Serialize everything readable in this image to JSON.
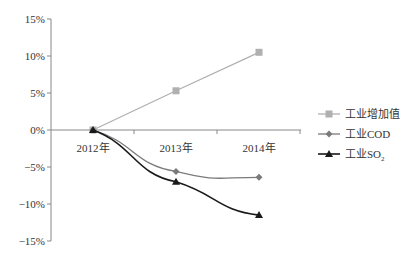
{
  "chart_data": {
    "type": "line",
    "title": "",
    "xlabel": "",
    "ylabel": "",
    "categories": [
      "2012年",
      "2013年",
      "2014年"
    ],
    "ylim": [
      -15,
      15
    ],
    "yticks": [
      15,
      10,
      5,
      0,
      -5,
      -10,
      -15
    ],
    "ytick_labels": [
      "15%",
      "10%",
      "5%",
      "0%",
      "-5%",
      "-10%",
      "-15%"
    ],
    "grid": false,
    "legend_position": "right",
    "series": [
      {
        "name": "工业增加值",
        "values": [
          0,
          5.3,
          10.5
        ],
        "color": "#b0b0b0",
        "marker": "square"
      },
      {
        "name": "工业COD",
        "values": [
          0,
          -5.6,
          -6.4
        ],
        "color": "#7a7a7a",
        "marker": "diamond"
      },
      {
        "name": "工业SO₂",
        "values": [
          0,
          -7.0,
          -11.5
        ],
        "color": "#1a1a1a",
        "marker": "triangle"
      }
    ]
  },
  "legend": {
    "items": [
      {
        "label": "工业增加值"
      },
      {
        "label": "工业COD"
      },
      {
        "label": "工业SO",
        "subscript": "2"
      }
    ]
  }
}
